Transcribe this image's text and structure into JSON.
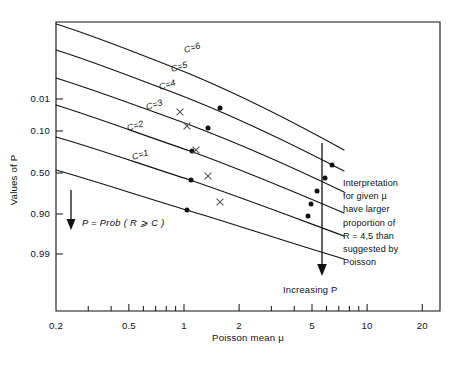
{
  "chart_data": {
    "type": "line",
    "title": "",
    "xlabel": "Poisson mean μ",
    "ylabel": "Values of P",
    "xscale": "log",
    "yscale": "probability",
    "xlim": [
      0.2,
      25
    ],
    "x_ticks": [
      {
        "value": 0.2,
        "label": "0.2"
      },
      {
        "value": 0.5,
        "label": "0.5"
      },
      {
        "value": 1,
        "label": "1"
      },
      {
        "value": 2,
        "label": "2"
      },
      {
        "value": 5,
        "label": "5"
      },
      {
        "value": 10,
        "label": "10"
      },
      {
        "value": 20,
        "label": "20"
      }
    ],
    "x_minor_ticks": [
      0.3,
      0.4,
      0.6,
      0.7,
      0.8,
      0.9,
      3,
      4,
      6,
      7,
      8,
      9
    ],
    "y_ticks": [
      {
        "value": 0.01,
        "label": "0.01"
      },
      {
        "value": 0.1,
        "label": "0.10"
      },
      {
        "value": 0.5,
        "label": "0.50"
      },
      {
        "value": 0.9,
        "label": "0.90"
      },
      {
        "value": 0.99,
        "label": "0.99"
      }
    ],
    "grid": false,
    "legend": "inline-curve-labels",
    "series": [
      {
        "name": "C = 1",
        "label": "C=1",
        "label_xy": [
          133,
          160
        ],
        "path": "M56,170 C95,181 140,196 190,211 C240,226 290,243 344,259"
      },
      {
        "name": "C = 2",
        "label": "C=2",
        "label_xy": [
          128,
          131
        ],
        "path": "M56,137 C95,148 140,164 190,180 C240,197 290,216 344,236"
      },
      {
        "name": "C = 3",
        "label": "C=3",
        "label_xy": [
          147,
          110
        ],
        "path": "M56,105 C95,117 140,134 190,151 C240,169 290,190 344,213"
      },
      {
        "name": "C = 4",
        "label": "C=4",
        "label_xy": [
          160,
          90
        ],
        "path": "M56,78 C95,90 140,107 190,125 C240,144 290,166 344,192"
      },
      {
        "name": "C = 5",
        "label": "C=5",
        "label_xy": [
          172,
          72
        ],
        "path": "M56,50 C95,62 140,80 190,99 C240,119 290,143 344,171"
      },
      {
        "name": "C = 6",
        "label": "C=6",
        "label_xy": [
          185,
          53
        ],
        "path": "M56,24 C95,36 140,54 190,74 C240,95 290,120 344,150"
      }
    ],
    "markers": {
      "dot_label": "observed-point",
      "x_label": "cross-point",
      "dots": [
        [
          187,
          210
        ],
        [
          191,
          180
        ],
        [
          192,
          151
        ],
        [
          220,
          108
        ],
        [
          208,
          128
        ],
        [
          311,
          204
        ],
        [
          317,
          191
        ],
        [
          325,
          178
        ],
        [
          308,
          216
        ],
        [
          332,
          165
        ]
      ],
      "crosses": [
        [
          220,
          202
        ],
        [
          208,
          176
        ],
        [
          196,
          150
        ],
        [
          187,
          126
        ],
        [
          180,
          112
        ]
      ]
    },
    "annotations": {
      "prob_definition": "P = Prob ( R ⩾ C )",
      "prob_arrow": "down-arrow",
      "increasing_p": "Increasing P",
      "increasing_arrow": "down-arrow",
      "interpretation_lines": [
        "Interpretation",
        "for given μ",
        "have larger",
        "proportion of",
        "R = 4,5 than",
        "suggested by",
        "Poisson"
      ]
    },
    "colors": {
      "ink": "#111111",
      "marker": "#111111",
      "cross": "#555555",
      "background": "#ffffff"
    }
  }
}
